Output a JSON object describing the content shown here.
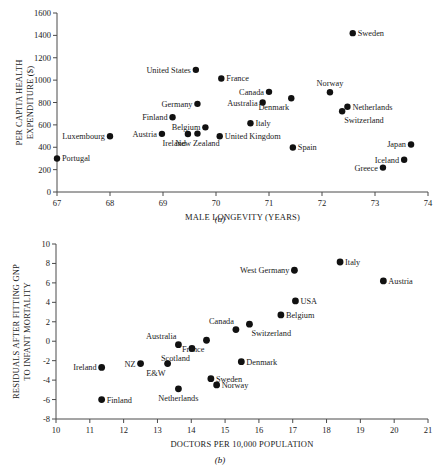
{
  "figure": {
    "panel_a_caption": "(a)",
    "panel_b_caption": "(b)"
  },
  "chart_data": [
    {
      "id": "panel-a",
      "type": "scatter",
      "title": "",
      "xlabel": "MALE LONGEVITY (YEARS)",
      "ylabel": "PER CAPITA HEALTH EXPENDITURE ($)",
      "ylabel_line1": "PER CAPITA HEALTH",
      "ylabel_line2": "EXPENDITURE ($)",
      "xlim": [
        67,
        74
      ],
      "ylim": [
        0,
        1600
      ],
      "xticks": [
        67,
        68,
        69,
        70,
        71,
        72,
        73,
        74
      ],
      "yticks": [
        0,
        200,
        400,
        600,
        800,
        1000,
        1200,
        1400,
        1600
      ],
      "grid": false,
      "legend": "none",
      "points": [
        {
          "label": "Portugal",
          "x": 67.0,
          "y": 300,
          "lpos": "right"
        },
        {
          "label": "Luxembourg",
          "x": 68.0,
          "y": 498,
          "lpos": "left"
        },
        {
          "label": "Austria",
          "x": 68.98,
          "y": 520,
          "lpos": "left"
        },
        {
          "label": "Finland",
          "x": 69.18,
          "y": 668,
          "lpos": "left"
        },
        {
          "label": "Ireland",
          "x": 69.47,
          "y": 518,
          "lpos": "below-left"
        },
        {
          "label": "New Zealand",
          "x": 69.65,
          "y": 522,
          "lpos": "below"
        },
        {
          "label": "Germany",
          "x": 69.65,
          "y": 788,
          "lpos": "left"
        },
        {
          "label": "Belgium",
          "x": 69.8,
          "y": 578,
          "lpos": "left"
        },
        {
          "label": "United States",
          "x": 69.62,
          "y": 1092,
          "lpos": "left"
        },
        {
          "label": "United Kingdom",
          "x": 70.07,
          "y": 498,
          "lpos": "right"
        },
        {
          "label": "France",
          "x": 70.1,
          "y": 1015,
          "lpos": "right"
        },
        {
          "label": "Australia",
          "x": 70.88,
          "y": 800,
          "lpos": "left"
        },
        {
          "label": "Canada",
          "x": 71.0,
          "y": 895,
          "lpos": "left"
        },
        {
          "label": "Italy",
          "x": 70.65,
          "y": 615,
          "lpos": "right"
        },
        {
          "label": "Spain",
          "x": 71.45,
          "y": 398,
          "lpos": "right"
        },
        {
          "label": "Denmark",
          "x": 71.42,
          "y": 838,
          "lpos": "below-left"
        },
        {
          "label": "Norway",
          "x": 72.15,
          "y": 892,
          "lpos": "above"
        },
        {
          "label": "Switzerland",
          "x": 72.38,
          "y": 722,
          "lpos": "below-right"
        },
        {
          "label": "Netherlands",
          "x": 72.48,
          "y": 762,
          "lpos": "right"
        },
        {
          "label": "Sweden",
          "x": 72.58,
          "y": 1420,
          "lpos": "right"
        },
        {
          "label": "Greece",
          "x": 73.15,
          "y": 218,
          "lpos": "left"
        },
        {
          "label": "Iceland",
          "x": 73.55,
          "y": 288,
          "lpos": "left"
        },
        {
          "label": "Japan",
          "x": 73.68,
          "y": 425,
          "lpos": "left"
        }
      ]
    },
    {
      "id": "panel-b",
      "type": "scatter",
      "title": "",
      "xlabel": "DOCTORS PER 10,000 POPULATION",
      "ylabel": "RESIDUALS AFTER FITTING GNP TO INFANT MORTALITY",
      "ylabel_line1": "RESIDUALS AFTER FITTING GNP",
      "ylabel_line2": "TO INFANT MORTALITY",
      "xlim": [
        10,
        21
      ],
      "ylim": [
        -8,
        10
      ],
      "xticks": [
        10,
        11,
        12,
        13,
        14,
        15,
        16,
        17,
        18,
        19,
        20,
        21
      ],
      "yticks": [
        -8,
        -6,
        -4,
        -2,
        0,
        2,
        4,
        6,
        8,
        10
      ],
      "grid": false,
      "legend": "none",
      "points": [
        {
          "label": "Ireland",
          "x": 11.35,
          "y": -2.7,
          "lpos": "left"
        },
        {
          "label": "Finland",
          "x": 11.35,
          "y": -6.0,
          "lpos": "right"
        },
        {
          "label": "NZ",
          "x": 12.5,
          "y": -2.3,
          "lpos": "left"
        },
        {
          "label": "E&W",
          "x": 13.3,
          "y": -2.3,
          "lpos": "below-left"
        },
        {
          "label": "Australia",
          "x": 13.62,
          "y": -0.35,
          "lpos": "above-left"
        },
        {
          "label": "Netherlands",
          "x": 13.62,
          "y": -4.9,
          "lpos": "below"
        },
        {
          "label": "Scotland",
          "x": 14.02,
          "y": -0.75,
          "lpos": "below-left"
        },
        {
          "label": "France",
          "x": 14.45,
          "y": 0.1,
          "lpos": "below-left"
        },
        {
          "label": "Sweden",
          "x": 14.58,
          "y": -3.85,
          "lpos": "right"
        },
        {
          "label": "Norway",
          "x": 14.75,
          "y": -4.5,
          "lpos": "right"
        },
        {
          "label": "Canada",
          "x": 15.32,
          "y": 1.2,
          "lpos": "above-left"
        },
        {
          "label": "Switzerland",
          "x": 15.72,
          "y": 1.75,
          "lpos": "below-right"
        },
        {
          "label": "Denmark",
          "x": 15.48,
          "y": -2.1,
          "lpos": "right"
        },
        {
          "label": "Belgium",
          "x": 16.65,
          "y": 2.7,
          "lpos": "right"
        },
        {
          "label": "USA",
          "x": 17.08,
          "y": 4.15,
          "lpos": "right"
        },
        {
          "label": "West Germany",
          "x": 17.05,
          "y": 7.3,
          "lpos": "left"
        },
        {
          "label": "Italy",
          "x": 18.4,
          "y": 8.15,
          "lpos": "right"
        },
        {
          "label": "Austria",
          "x": 19.68,
          "y": 6.2,
          "lpos": "right"
        }
      ]
    }
  ]
}
